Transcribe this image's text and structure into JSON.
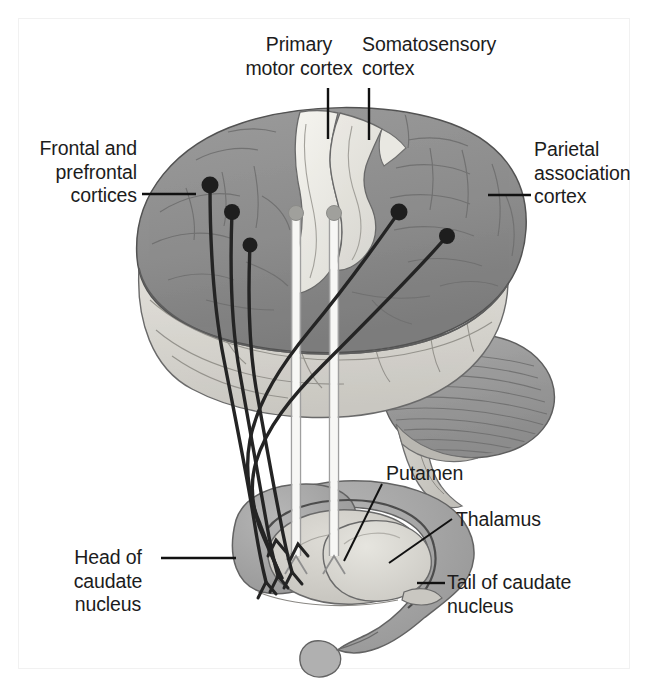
{
  "figure": {
    "background_color": "#ffffff",
    "border_color": "#f2f2f2",
    "width": 648,
    "height": 687
  },
  "palette": {
    "cortex_gray": "#8e8e8e",
    "cortex_gray_dark": "#7b7b7b",
    "precentral_light": "#efeee8",
    "postcentral_light": "#e6e5df",
    "temporal_light": "#d9d7d1",
    "cerebellum_gray": "#9a9a9a",
    "brainstem_light": "#cfcdc7",
    "caudate_gray": "#a5a5a5",
    "caudate_rim": "#8c8c8c",
    "putamen_light": "#cfcec8",
    "thalamus_light": "#dbdad4",
    "outline": "#4a4a4a",
    "fiber_dark": "#242424",
    "fiber_light": "#f5f5f2",
    "fiber_light_edge": "#a9a9a9",
    "leader_line": "#111111",
    "text": "#1c1c1c"
  },
  "labels": [
    {
      "id": "primary-motor-cortex",
      "text": "Primary\nmotor cortex",
      "align": "center",
      "left": 224,
      "top": 33,
      "width": 150
    },
    {
      "id": "somatosensory-cortex",
      "text": "Somatosensory\ncortex",
      "align": "left",
      "left": 362,
      "top": 33,
      "width": 160
    },
    {
      "id": "frontal-and-prefrontal-cortices",
      "text": "Frontal and\nprefrontal\ncortices",
      "align": "right",
      "left": 0,
      "top": 137,
      "width": 137
    },
    {
      "id": "parietal-association-cortex",
      "text": "Parietal\nassociation\ncortex",
      "align": "left",
      "left": 534,
      "top": 138,
      "width": 120
    },
    {
      "id": "putamen",
      "text": "Putamen",
      "align": "left",
      "left": 386,
      "top": 462,
      "width": 120
    },
    {
      "id": "thalamus",
      "text": "Thalamus",
      "align": "left",
      "left": 456,
      "top": 508,
      "width": 120
    },
    {
      "id": "head-of-caudate-nucleus",
      "text": "Head of\ncaudate\nnucleus",
      "align": "center",
      "left": 52,
      "top": 546,
      "width": 112
    },
    {
      "id": "tail-of-caudate-nucleus",
      "text": "Tail of caudate\nnucleus",
      "align": "left",
      "left": 447,
      "top": 571,
      "width": 190
    }
  ],
  "leader_lines": [
    {
      "id": "leader-primary-motor-cortex",
      "x1": 328,
      "y1": 88,
      "x2": 328,
      "y2": 139
    },
    {
      "id": "leader-somatosensory-cortex",
      "x1": 369,
      "y1": 88,
      "x2": 369,
      "y2": 140
    },
    {
      "id": "leader-frontal-prefrontal",
      "x1": 142,
      "y1": 194,
      "x2": 196,
      "y2": 194
    },
    {
      "id": "leader-parietal-association",
      "x1": 488,
      "y1": 195,
      "x2": 531,
      "y2": 195
    },
    {
      "id": "leader-putamen",
      "x1": 382,
      "y1": 484,
      "x2": 344,
      "y2": 561
    },
    {
      "id": "leader-thalamus",
      "x1": 452,
      "y1": 519,
      "x2": 389,
      "y2": 563
    },
    {
      "id": "leader-head-of-caudate",
      "x1": 161,
      "y1": 558,
      "x2": 236,
      "y2": 558
    },
    {
      "id": "leader-tail-of-caudate",
      "x1": 417,
      "y1": 583,
      "x2": 445,
      "y2": 583
    }
  ],
  "cortical_origins": [
    {
      "id": "origin-frontal-1",
      "cx": 210,
      "cy": 185,
      "r": 8.5,
      "type": "dark"
    },
    {
      "id": "origin-frontal-2",
      "cx": 232,
      "cy": 212,
      "r": 8.0,
      "type": "dark"
    },
    {
      "id": "origin-frontal-3",
      "cx": 250,
      "cy": 245,
      "r": 7.5,
      "type": "dark"
    },
    {
      "id": "origin-motor",
      "cx": 296,
      "cy": 213,
      "r": 7.5,
      "type": "light"
    },
    {
      "id": "origin-somatosensory",
      "cx": 334,
      "cy": 213,
      "r": 7.5,
      "type": "light"
    },
    {
      "id": "origin-parietal-1",
      "cx": 399,
      "cy": 212,
      "r": 8.5,
      "type": "dark"
    },
    {
      "id": "origin-parietal-2",
      "cx": 447,
      "cy": 236,
      "r": 8.0,
      "type": "dark"
    }
  ],
  "structures": {
    "cerebral_cortex": "lateral view of left cerebral hemisphere",
    "precentral_gyrus": "primary motor cortex strip",
    "postcentral_gyrus": "somatosensory cortex strip",
    "cerebellum": "cerebellum with folia",
    "brainstem": "brainstem",
    "caudate_nucleus": "C-shaped caudate with head, body and tail",
    "putamen": "putamen lens shape",
    "thalamus": "thalamus oval",
    "amygdala": "amygdaloid bulb at tail tip"
  }
}
